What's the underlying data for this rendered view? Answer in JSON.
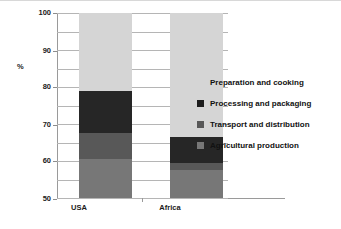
{
  "chart_data": {
    "type": "bar",
    "subtype": "stacked-100-percent",
    "title": "",
    "xlabel": "",
    "ylabel": "%",
    "ylim": [
      0,
      100
    ],
    "ytick_step": 10,
    "yticks": [
      100,
      90,
      80,
      70,
      60,
      50,
      40,
      30,
      20,
      10,
      0
    ],
    "grid": true,
    "legend_position": "right-middle",
    "categories": [
      "USA",
      "Africa"
    ],
    "series": [
      {
        "name": "Preparation and cooking",
        "color": "#d5d5d5",
        "values": [
          42,
          67
        ]
      },
      {
        "name": "Processing and packaging",
        "color": "#262626",
        "values": [
          23,
          14
        ]
      },
      {
        "name": "Transport and distribution",
        "color": "#585858",
        "values": [
          14,
          4
        ]
      },
      {
        "name": "Agricultural production",
        "color": "#777777",
        "values": [
          21,
          15
        ]
      }
    ],
    "stack_bounds": {
      "USA": {
        "Agricultural production": [
          0,
          21
        ],
        "Transport and distribution": [
          21,
          35
        ],
        "Processing and packaging": [
          35,
          58
        ],
        "Preparation and cooking": [
          58,
          100
        ]
      },
      "Africa": {
        "Agricultural production": [
          0,
          15
        ],
        "Transport and distribution": [
          15,
          19
        ],
        "Processing and packaging": [
          19,
          33
        ],
        "Preparation and cooking": [
          33,
          100
        ]
      }
    }
  },
  "legend": {
    "items": [
      {
        "label": "Preparation and cooking",
        "color": "#d5d5d5"
      },
      {
        "label": "Processing and packaging",
        "color": "#1c1c1c"
      },
      {
        "label": "Transport and distribution",
        "color": "#585858"
      },
      {
        "label": "Agricultural production",
        "color": "#777777"
      }
    ]
  },
  "axis": {
    "y_title": "%",
    "ticks": [
      "100",
      "90",
      "80",
      "70",
      "60",
      "50",
      "40",
      "30",
      "20",
      "10",
      "0"
    ]
  },
  "categories": [
    {
      "label": "USA"
    },
    {
      "label": "Africa"
    }
  ]
}
